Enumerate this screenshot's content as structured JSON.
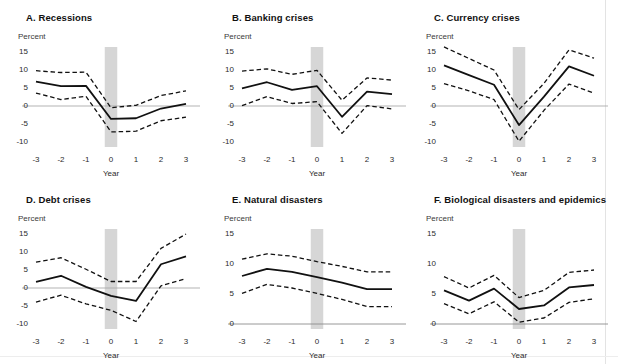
{
  "figure": {
    "percent_label": "Percent",
    "x_axis_label": "Year",
    "x_categories": [
      "-3",
      "-2",
      "-1",
      "0",
      "1",
      "2",
      "3"
    ],
    "event_band_year": "0",
    "colors": {
      "line": "#111111",
      "ci": "#111111",
      "zero_line": "#aaaaaa",
      "axis": "#8c8c8c",
      "band": "#d6d6d6",
      "background": "#ffffff",
      "text": "#1a1a1a"
    }
  },
  "chart_data": [
    {
      "panel": "A",
      "type": "line",
      "title": "A. Recessions",
      "xlabel": "Year",
      "ylabel": "Percent",
      "x": [
        -3,
        -2,
        -1,
        0,
        1,
        2,
        3
      ],
      "xticklabels": [
        "-3",
        "-2",
        "-1",
        "0",
        "1",
        "2",
        "3"
      ],
      "ylim": [
        -10,
        15
      ],
      "yticks": [
        15,
        10,
        5,
        0,
        -5,
        -10
      ],
      "yticklabels": [
        "15",
        "10",
        "5",
        "0",
        "-5",
        "-10"
      ],
      "grid": false,
      "legend": "none",
      "shaded_band": {
        "from": -0.25,
        "to": 0.25,
        "label": "event year 0"
      },
      "series": [
        {
          "name": "Point estimate",
          "style": "solid",
          "values": [
            6.8,
            5.5,
            5.6,
            -3.6,
            -3.4,
            -0.7,
            0.6
          ]
        },
        {
          "name": "Upper 90% confidence band",
          "style": "dashed",
          "values": [
            9.8,
            9.3,
            9.4,
            -0.5,
            0.2,
            2.9,
            4.2
          ]
        },
        {
          "name": "Lower 90% confidence band",
          "style": "dashed",
          "values": [
            3.6,
            1.8,
            2.7,
            -7.2,
            -7.0,
            -4.1,
            -3.1
          ]
        }
      ]
    },
    {
      "panel": "B",
      "type": "line",
      "title": "B. Banking crises",
      "xlabel": "Year",
      "ylabel": "Percent",
      "x": [
        -3,
        -2,
        -1,
        0,
        1,
        2,
        3
      ],
      "xticklabels": [
        "-3",
        "-2",
        "-1",
        "0",
        "1",
        "2",
        "3"
      ],
      "ylim": [
        -10,
        15
      ],
      "yticks": [
        15,
        10,
        5,
        0,
        -5,
        -10
      ],
      "yticklabels": [
        "15",
        "10",
        "5",
        "0",
        "-5",
        "-10"
      ],
      "grid": false,
      "legend": "none",
      "shaded_band": {
        "from": -0.25,
        "to": 0.25,
        "label": "event year 0"
      },
      "series": [
        {
          "name": "Point estimate",
          "style": "solid",
          "values": [
            4.9,
            6.6,
            4.5,
            5.5,
            -3.0,
            4.0,
            3.3
          ]
        },
        {
          "name": "Upper 90% confidence band",
          "style": "dashed",
          "values": [
            9.7,
            10.3,
            8.8,
            9.9,
            1.6,
            7.8,
            7.2
          ]
        },
        {
          "name": "Lower 90% confidence band",
          "style": "dashed",
          "values": [
            0.1,
            2.6,
            0.7,
            1.2,
            -7.6,
            0.1,
            -0.8
          ]
        }
      ]
    },
    {
      "panel": "C",
      "type": "line",
      "title": "C. Currency crises",
      "xlabel": "Year",
      "ylabel": "Percent",
      "x": [
        -3,
        -2,
        -1,
        0,
        1,
        2,
        3
      ],
      "xticklabels": [
        "-3",
        "-2",
        "-1",
        "0",
        "1",
        "2",
        "3"
      ],
      "ylim": [
        -10,
        15
      ],
      "yticks": [
        15,
        10,
        5,
        0,
        -5,
        -10
      ],
      "yticklabels": [
        "15",
        "10",
        "5",
        "0",
        "-5",
        "-10"
      ],
      "grid": false,
      "legend": "none",
      "shaded_band": {
        "from": -0.25,
        "to": 0.25,
        "label": "event year 0"
      },
      "series": [
        {
          "name": "Point estimate",
          "style": "solid",
          "values": [
            11.3,
            8.6,
            5.9,
            -5.3,
            2.6,
            11.0,
            8.4
          ]
        },
        {
          "name": "Upper 90% confidence band",
          "style": "dashed",
          "values": [
            16.4,
            13.2,
            10.0,
            -1.0,
            6.3,
            15.6,
            13.3
          ]
        },
        {
          "name": "Lower 90% confidence band",
          "style": "dashed",
          "values": [
            6.2,
            4.2,
            1.8,
            -9.8,
            -1.2,
            6.1,
            3.6
          ]
        }
      ]
    },
    {
      "panel": "D",
      "type": "line",
      "title": "D. Debt crises",
      "xlabel": "Year",
      "ylabel": "Percent",
      "x": [
        -3,
        -2,
        -1,
        0,
        1,
        2,
        3
      ],
      "xticklabels": [
        "-3",
        "-2",
        "-1",
        "0",
        "1",
        "2",
        "3"
      ],
      "ylim": [
        -10,
        15
      ],
      "yticks": [
        15,
        10,
        5,
        0,
        -5,
        -10
      ],
      "yticklabels": [
        "15",
        "10",
        "5",
        "0",
        "-5",
        "-10"
      ],
      "grid": false,
      "legend": "none",
      "shaded_band": {
        "from": -0.25,
        "to": 0.25,
        "label": "event year 0"
      },
      "series": [
        {
          "name": "Point estimate",
          "style": "solid",
          "values": [
            1.7,
            3.4,
            0.3,
            -2.2,
            -3.6,
            6.6,
            8.8
          ]
        },
        {
          "name": "Upper 90% confidence band",
          "style": "dashed",
          "values": [
            7.2,
            8.4,
            5.2,
            1.8,
            1.8,
            11.0,
            15.0
          ]
        },
        {
          "name": "Lower 90% confidence band",
          "style": "dashed",
          "values": [
            -3.9,
            -2.0,
            -4.4,
            -6.2,
            -9.3,
            0.6,
            2.6
          ]
        }
      ]
    },
    {
      "panel": "E",
      "type": "line",
      "title": "E. Natural disasters",
      "xlabel": "Year",
      "ylabel": "Percent",
      "x": [
        -3,
        -2,
        -1,
        0,
        1,
        2,
        3
      ],
      "xticklabels": [
        "-3",
        "-2",
        "-1",
        "0",
        "1",
        "2",
        "3"
      ],
      "ylim": [
        0,
        15
      ],
      "yticks": [
        15,
        10,
        5,
        0
      ],
      "yticklabels": [
        "15",
        "10",
        "5",
        "0"
      ],
      "grid": false,
      "legend": "none",
      "shaded_band": {
        "from": -0.25,
        "to": 0.25,
        "label": "event year 0"
      },
      "series": [
        {
          "name": "Point estimate",
          "style": "solid",
          "values": [
            8.0,
            9.2,
            8.7,
            7.8,
            6.9,
            5.8,
            5.8
          ]
        },
        {
          "name": "Upper 90% confidence band",
          "style": "dashed",
          "values": [
            10.8,
            11.7,
            11.3,
            10.4,
            9.6,
            8.7,
            8.7
          ]
        },
        {
          "name": "Lower 90% confidence band",
          "style": "dashed",
          "values": [
            5.1,
            6.6,
            6.0,
            5.1,
            4.1,
            2.9,
            2.9
          ]
        }
      ]
    },
    {
      "panel": "F",
      "type": "line",
      "title": "F. Biological disasters and epidemics",
      "xlabel": "Year",
      "ylabel": "Percent",
      "x": [
        -3,
        -2,
        -1,
        0,
        1,
        2,
        3
      ],
      "xticklabels": [
        "-3",
        "-2",
        "-1",
        "0",
        "1",
        "2",
        "3"
      ],
      "ylim": [
        0,
        15
      ],
      "yticks": [
        15,
        10,
        5,
        0
      ],
      "yticklabels": [
        "15",
        "10",
        "5",
        "0"
      ],
      "grid": false,
      "legend": "none",
      "shaded_band": {
        "from": -0.25,
        "to": 0.25,
        "label": "event year 0"
      },
      "series": [
        {
          "name": "Point estimate",
          "style": "solid",
          "values": [
            5.6,
            3.9,
            5.9,
            2.5,
            3.1,
            6.1,
            6.5
          ]
        },
        {
          "name": "Upper 90% confidence band",
          "style": "dashed",
          "values": [
            7.9,
            6.0,
            8.1,
            4.4,
            5.6,
            8.6,
            9.0
          ]
        },
        {
          "name": "Lower 90% confidence band",
          "style": "dashed",
          "values": [
            3.4,
            1.7,
            3.7,
            0.3,
            1.0,
            3.6,
            4.2
          ]
        }
      ]
    }
  ]
}
